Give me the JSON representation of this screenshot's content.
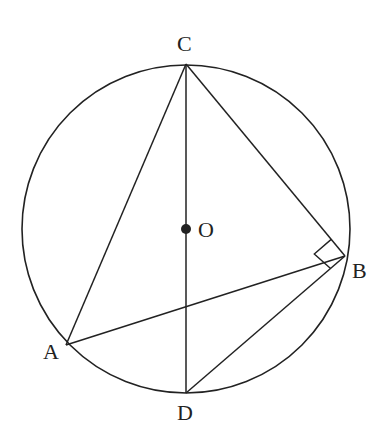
{
  "diagram": {
    "type": "circle-geometry",
    "stroke_color": "#222222",
    "circle": {
      "center": "O",
      "cx": 186,
      "cy": 229,
      "r": 165
    },
    "points": {
      "C": {
        "label": "C",
        "x": 186,
        "y": 64
      },
      "O": {
        "label": "O",
        "x": 186,
        "y": 229
      },
      "B": {
        "label": "B",
        "x": 345,
        "y": 256
      },
      "A": {
        "label": "A",
        "x": 66,
        "y": 345
      },
      "D": {
        "label": "D",
        "x": 186,
        "y": 393
      }
    },
    "segments": [
      "CA",
      "CB",
      "CD",
      "AB",
      "BD"
    ],
    "right_angle_at": "B",
    "labels": {
      "C": "C",
      "O": "O",
      "B": "B",
      "A": "A",
      "D": "D"
    }
  }
}
